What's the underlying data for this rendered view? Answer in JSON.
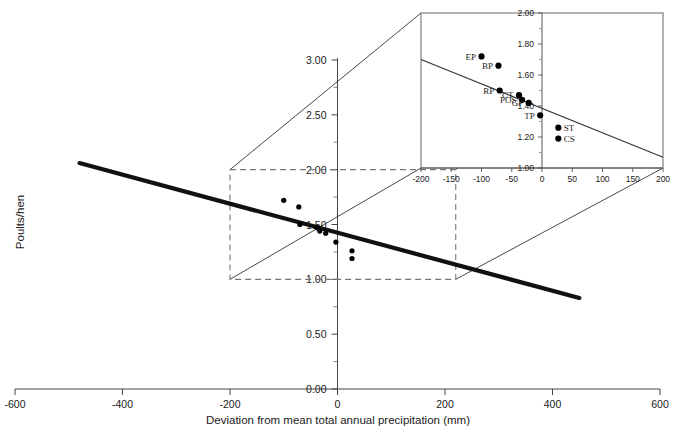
{
  "figure": {
    "background": "#ffffff",
    "line_color": "#111111",
    "point_color": "#000000",
    "dashed_color": "#777777"
  },
  "main": {
    "xlabel": "Deviation from mean total annual precipitation (mm)",
    "ylabel": "Poults/hen",
    "xticks": [
      "-600",
      "-400",
      "-200",
      "0",
      "200",
      "400",
      "600"
    ],
    "xtick_values": [
      -600,
      -400,
      -200,
      0,
      200,
      400,
      600
    ],
    "yticks": [
      "0.00",
      "0.50",
      "1.00",
      "1.50",
      "2.00",
      "2.50",
      "3.00"
    ],
    "ytick_values": [
      0.0,
      0.5,
      1.0,
      1.5,
      2.0,
      2.5,
      3.0
    ],
    "xlim": [
      -650,
      650
    ],
    "ylim": [
      0.0,
      3.15
    ]
  },
  "inset": {
    "xticks": [
      "-200",
      "-150",
      "-100",
      "-50",
      "0",
      "50",
      "100",
      "150",
      "200"
    ],
    "xtick_values": [
      -200,
      -150,
      -100,
      -50,
      0,
      50,
      100,
      150,
      200
    ],
    "yticks": [
      "1.00",
      "1.20",
      "1.40",
      "1.60",
      "1.80",
      "2.00"
    ],
    "ytick_values": [
      1.0,
      1.2,
      1.4,
      1.6,
      1.8,
      2.0
    ],
    "xlim": [
      -200,
      200
    ],
    "ylim": [
      1.0,
      2.0
    ]
  },
  "zoom_box": {
    "x_range": [
      -200,
      220
    ],
    "y_range": [
      1.0,
      2.0
    ]
  },
  "chart_data": {
    "type": "scatter",
    "title": "",
    "xlabel": "Deviation from mean total annual precipitation (mm)",
    "ylabel": "Poults/hen",
    "xlim": [
      -650,
      650
    ],
    "ylim": [
      0.0,
      3.15
    ],
    "grid": false,
    "legend": "none",
    "series": [
      {
        "name": "Sites",
        "type": "scatter",
        "labels": [
          "EP",
          "BP",
          "RP",
          "CT",
          "POS",
          "GP",
          "TP",
          "ST",
          "CS"
        ],
        "x": [
          -100,
          -72,
          -70,
          -38,
          -33,
          -22,
          -3,
          27,
          27
        ],
        "y": [
          1.72,
          1.66,
          1.5,
          1.47,
          1.44,
          1.42,
          1.34,
          1.26,
          1.19
        ]
      },
      {
        "name": "Regression line (fitted, thick)",
        "type": "line",
        "x": [
          -480,
          450
        ],
        "y": [
          2.06,
          0.83
        ]
      }
    ],
    "annotations": [
      "Inset panel magnifies region x in [-200, 220], y in [1.00, 2.00]",
      "Dashed rectangle on main axes marks the magnified region",
      "Thin connector lines join dashed box corners to inset panel corners"
    ]
  },
  "inset_points": [
    {
      "label": "EP",
      "x": -100,
      "y": 1.72,
      "label_side": "left"
    },
    {
      "label": "BP",
      "x": -72,
      "y": 1.66,
      "label_side": "left"
    },
    {
      "label": "RP",
      "x": -70,
      "y": 1.5,
      "label_side": "left"
    },
    {
      "label": "CT",
      "x": -38,
      "y": 1.47,
      "label_side": "left"
    },
    {
      "label": "POS",
      "x": -33,
      "y": 1.44,
      "label_side": "left"
    },
    {
      "label": "GP",
      "x": -22,
      "y": 1.42,
      "label_side": "left"
    },
    {
      "label": "TP",
      "x": -3,
      "y": 1.34,
      "label_side": "left"
    },
    {
      "label": "ST",
      "x": 27,
      "y": 1.26,
      "label_side": "right"
    },
    {
      "label": "CS",
      "x": 27,
      "y": 1.19,
      "label_side": "right"
    }
  ],
  "inset_line": {
    "x": [
      -200,
      200
    ],
    "y": [
      1.7,
      1.07
    ]
  }
}
